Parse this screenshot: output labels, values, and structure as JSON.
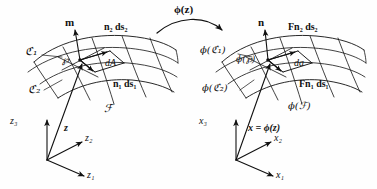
{
  "figure": {
    "type": "continuum-mechanics-diagram",
    "ink_color": "#111111",
    "background": "#ffffff"
  },
  "map_arrow": {
    "label": "ϕ(z)",
    "direction": "left-to-right"
  },
  "reference_config": {
    "normal_vector": "m",
    "area_element": "dA",
    "edge_1": "n₁ ds₁",
    "edge_2": "n₂ ds₂",
    "curve_1": "ℭ₁",
    "curve_2": "ℭ₂",
    "point": "℘",
    "surface": "ℱ",
    "position_vector": "z",
    "axes": [
      "z₁",
      "z₂",
      "z₃"
    ]
  },
  "deformed_config": {
    "normal_vector": "n",
    "area_element": "da",
    "edge_1": "Fn₁ ds₁",
    "edge_2": "Fn₂ ds₂",
    "curve_1": "ϕ(ℭ₁)",
    "curve_2": "ϕ(ℭ₂)",
    "point": "ϕ(℘)",
    "surface": "ϕ(ℱ)",
    "position_vector": "x = ϕ(z)",
    "axes": [
      "x₁",
      "x₂",
      "x₃"
    ]
  }
}
